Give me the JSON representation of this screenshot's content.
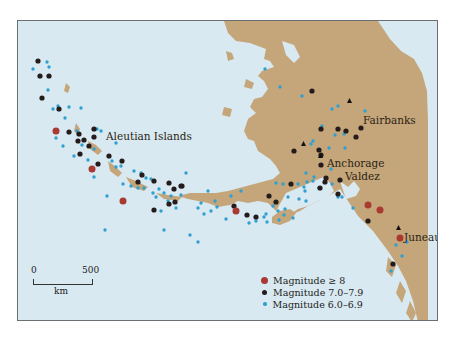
{
  "map": {
    "title": "",
    "colors": {
      "ocean": "#d9e9f1",
      "land": "#c5a67a",
      "frame": "#6a6f73",
      "mag8": "#a83a32",
      "mag7": "#241c1a",
      "mag6": "#2fa0d0"
    },
    "region_label": "Aleutian Islands",
    "cities": [
      {
        "name": "Fairbanks",
        "x": 350,
        "y": 100
      },
      {
        "name": "Anchorage",
        "x": 304,
        "y": 143
      },
      {
        "name": "Valdez",
        "x": 321,
        "y": 155
      },
      {
        "name": "Juneau",
        "x": 399,
        "y": 227
      }
    ],
    "scale_bar": {
      "start_label": "0",
      "end_label": "500",
      "unit": "km"
    },
    "legend": {
      "items": [
        {
          "label": "Magnitude ≥ 8",
          "color": "#a83a32",
          "size": 7
        },
        {
          "label": "Magnitude 7.0–7.9",
          "color": "#241c1a",
          "size": 5
        },
        {
          "label": "Magnitude 6.0–6.9",
          "color": "#2fa0d0",
          "size": 3.5
        }
      ]
    },
    "earthquakes": {
      "mag8": [
        [
          55,
          130
        ],
        [
          91,
          168
        ],
        [
          122,
          200
        ],
        [
          235,
          210
        ],
        [
          367,
          204
        ],
        [
          379,
          209
        ],
        [
          399,
          237
        ]
      ],
      "mag7": [
        [
          37,
          60
        ],
        [
          39,
          75
        ],
        [
          48,
          75
        ],
        [
          41,
          97
        ],
        [
          58,
          108
        ],
        [
          68,
          131
        ],
        [
          78,
          133
        ],
        [
          93,
          128
        ],
        [
          77,
          140
        ],
        [
          83,
          139
        ],
        [
          93,
          136
        ],
        [
          88,
          145
        ],
        [
          79,
          153
        ],
        [
          97,
          163
        ],
        [
          108,
          155
        ],
        [
          121,
          160
        ],
        [
          141,
          174
        ],
        [
          137,
          181
        ],
        [
          153,
          180
        ],
        [
          168,
          182
        ],
        [
          173,
          188
        ],
        [
          181,
          185
        ],
        [
          168,
          203
        ],
        [
          153,
          209
        ],
        [
          174,
          201
        ],
        [
          180,
          185
        ],
        [
          233,
          205
        ],
        [
          246,
          214
        ],
        [
          255,
          216
        ],
        [
          268,
          195
        ],
        [
          275,
          201
        ],
        [
          290,
          183
        ],
        [
          311,
          90
        ],
        [
          293,
          150
        ],
        [
          320,
          154
        ],
        [
          319,
          187
        ],
        [
          324,
          181
        ],
        [
          337,
          193
        ],
        [
          320,
          128
        ],
        [
          337,
          128
        ],
        [
          355,
          136
        ],
        [
          360,
          127
        ],
        [
          367,
          220
        ],
        [
          392,
          263
        ],
        [
          320,
          164
        ],
        [
          325,
          177
        ],
        [
          339,
          179
        ],
        [
          318,
          149
        ],
        [
          345,
          130
        ]
      ],
      "mag6": [
        [
          32,
          68
        ],
        [
          46,
          61
        ],
        [
          48,
          66
        ],
        [
          47,
          89
        ],
        [
          57,
          105
        ],
        [
          52,
          108
        ],
        [
          68,
          106
        ],
        [
          80,
          107
        ],
        [
          64,
          117
        ],
        [
          55,
          137
        ],
        [
          62,
          145
        ],
        [
          76,
          130
        ],
        [
          93,
          148
        ],
        [
          96,
          128
        ],
        [
          100,
          130
        ],
        [
          87,
          159
        ],
        [
          73,
          155
        ],
        [
          108,
          155
        ],
        [
          111,
          160
        ],
        [
          115,
          142
        ],
        [
          120,
          165
        ],
        [
          133,
          170
        ],
        [
          140,
          172
        ],
        [
          137,
          187
        ],
        [
          145,
          177
        ],
        [
          152,
          192
        ],
        [
          155,
          196
        ],
        [
          163,
          192
        ],
        [
          170,
          195
        ],
        [
          180,
          194
        ],
        [
          185,
          172
        ],
        [
          160,
          210
        ],
        [
          167,
          200
        ],
        [
          175,
          207
        ],
        [
          197,
          207
        ],
        [
          203,
          213
        ],
        [
          210,
          210
        ],
        [
          216,
          206
        ],
        [
          225,
          218
        ],
        [
          248,
          222
        ],
        [
          255,
          220
        ],
        [
          263,
          216
        ],
        [
          266,
          221
        ],
        [
          278,
          219
        ],
        [
          283,
          214
        ],
        [
          292,
          217
        ],
        [
          298,
          198
        ],
        [
          305,
          200
        ],
        [
          306,
          181
        ],
        [
          313,
          176
        ],
        [
          331,
          183
        ],
        [
          337,
          196
        ],
        [
          341,
          196
        ],
        [
          352,
          207
        ],
        [
          104,
          229
        ],
        [
          163,
          229
        ],
        [
          189,
          234
        ],
        [
          197,
          241
        ],
        [
          264,
          68
        ],
        [
          279,
          86
        ],
        [
          301,
          95
        ],
        [
          331,
          108
        ],
        [
          337,
          105
        ],
        [
          364,
          110
        ],
        [
          321,
          125
        ],
        [
          334,
          134
        ],
        [
          343,
          133
        ],
        [
          312,
          140
        ],
        [
          310,
          143
        ],
        [
          328,
          147
        ],
        [
          344,
          147
        ],
        [
          305,
          172
        ],
        [
          330,
          168
        ],
        [
          401,
          255
        ],
        [
          390,
          270
        ],
        [
          395,
          244
        ],
        [
          406,
          241
        ],
        [
          304,
          190
        ],
        [
          122,
          183
        ],
        [
          106,
          195
        ],
        [
          93,
          176
        ],
        [
          81,
          144
        ],
        [
          115,
          166
        ],
        [
          130,
          185
        ],
        [
          143,
          187
        ],
        [
          150,
          178
        ],
        [
          158,
          188
        ],
        [
          200,
          202
        ],
        [
          207,
          190
        ],
        [
          214,
          200
        ],
        [
          230,
          195
        ],
        [
          240,
          190
        ],
        [
          275,
          182
        ],
        [
          282,
          183
        ],
        [
          287,
          196
        ],
        [
          272,
          205
        ],
        [
          265,
          213
        ],
        [
          277,
          210
        ],
        [
          284,
          208
        ],
        [
          297,
          183
        ],
        [
          303,
          186
        ],
        [
          312,
          180
        ],
        [
          318,
          187
        ]
      ]
    }
  }
}
